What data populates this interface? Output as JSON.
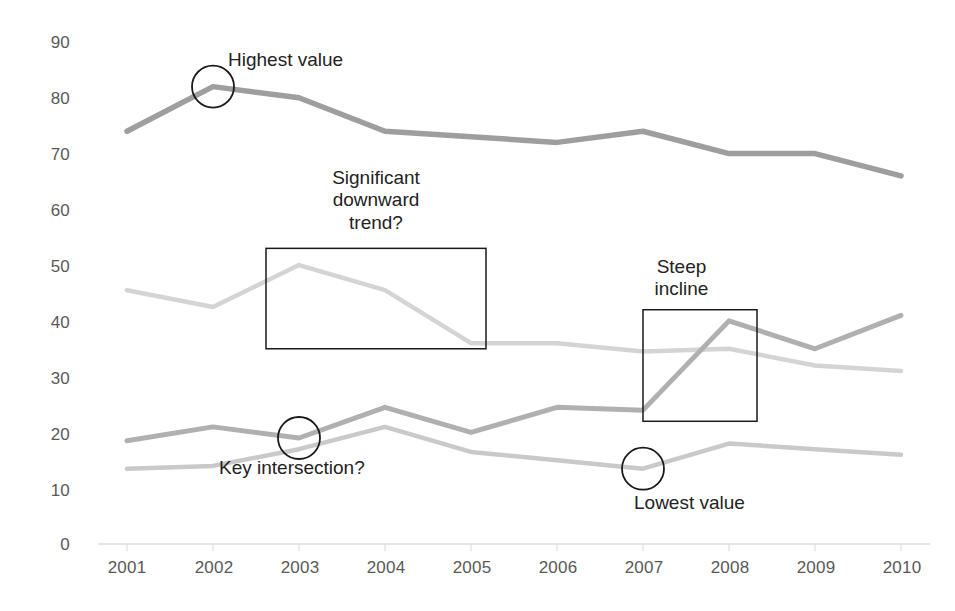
{
  "chart_data": {
    "type": "line",
    "title": "",
    "xlabel": "",
    "ylabel": "",
    "categories": [
      "2001",
      "2002",
      "2003",
      "2004",
      "2005",
      "2006",
      "2007",
      "2008",
      "2009",
      "2010"
    ],
    "ylim": [
      0,
      90
    ],
    "xlim": [
      "2001",
      "2010"
    ],
    "grid": false,
    "legend": "none",
    "yticks": [
      "0",
      "10",
      "20",
      "30",
      "40",
      "50",
      "60",
      "70",
      "80",
      "90"
    ],
    "ytick_values": [
      0,
      10,
      20,
      30,
      40,
      50,
      60,
      70,
      80,
      90
    ],
    "series": [
      {
        "name": "series-1-top",
        "color": "#9e9e9e",
        "values": [
          74,
          82,
          80,
          74,
          73,
          72,
          74,
          70,
          70,
          66
        ]
      },
      {
        "name": "series-2-light",
        "color": "#d4d4d4",
        "values": [
          45.5,
          42.5,
          50,
          45.5,
          36,
          36,
          34.5,
          35,
          32,
          31
        ]
      },
      {
        "name": "series-3-mid",
        "color": "#b0b0b0",
        "values": [
          18.5,
          21,
          19,
          24.5,
          20,
          24.5,
          24,
          40,
          35,
          41
        ]
      },
      {
        "name": "series-4-low",
        "color": "#c9c9c9",
        "values": [
          13.5,
          14,
          17,
          21,
          16.5,
          15,
          13.5,
          18,
          17,
          16
        ]
      }
    ],
    "annotations": [
      {
        "id": "highest-value",
        "text": "Highest value",
        "marker": "circle",
        "target_series": "series-1-top",
        "target_x": "2002",
        "target_y": 82
      },
      {
        "id": "significant-downward-trend",
        "text": "Significant\ndownward\ntrend?",
        "text_lines": [
          "Significant",
          "downward",
          "trend?"
        ],
        "marker": "rectangle",
        "target_series": "series-2-light",
        "x_range": [
          "2002",
          "2005"
        ],
        "y_range": [
          35,
          53
        ]
      },
      {
        "id": "steep-incline",
        "text": "Steep\nincline",
        "text_lines": [
          "Steep",
          "incline"
        ],
        "marker": "rectangle",
        "target_series": "series-3-mid",
        "x_range": [
          "2007",
          "2008"
        ],
        "y_range": [
          22,
          42
        ]
      },
      {
        "id": "key-intersection",
        "text": "Key intersection?",
        "marker": "circle",
        "target_x": "2003",
        "target_y": 19
      },
      {
        "id": "lowest-value",
        "text": "Lowest value",
        "marker": "circle",
        "target_series": "series-4-low",
        "target_x": "2007",
        "target_y": 13.5
      }
    ]
  },
  "axis": {
    "y_labels": [
      "90",
      "80",
      "70",
      "60",
      "50",
      "40",
      "30",
      "20",
      "10",
      "0"
    ],
    "x_labels": [
      "2001",
      "2002",
      "2003",
      "2004",
      "2005",
      "2006",
      "2007",
      "2008",
      "2009",
      "2010"
    ]
  },
  "annotation_text": {
    "highest_value": "Highest value",
    "significant_1": "Significant",
    "significant_2": "downward",
    "significant_3": "trend?",
    "steep_1": "Steep",
    "steep_2": "incline",
    "key_intersection": "Key intersection?",
    "lowest_value": "Lowest value"
  },
  "colors": {
    "series_1": "#9e9e9e",
    "series_2": "#d4d4d4",
    "series_3": "#b0b0b0",
    "series_4": "#c9c9c9",
    "axis": "#d9d9d9",
    "annotation_stroke": "#1a1a1a",
    "tick_text": "#595959",
    "annotation_text": "#232323"
  }
}
